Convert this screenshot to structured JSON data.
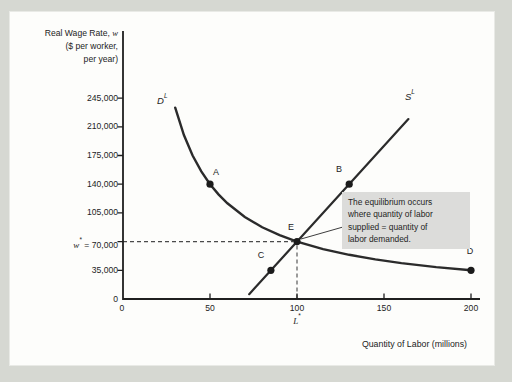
{
  "figure": {
    "colors": {
      "page_bg": "#d6d8d2",
      "panel_bg": "#fdfdfb",
      "ink": "#232323",
      "annotation_bg": "#dcdcda"
    },
    "y_axis": {
      "title_prefix": "Real Wage Rate, ",
      "title_var": "w",
      "title_line2": "($ per worker,",
      "title_line3": "per year)",
      "tick_labels": [
        "245,000",
        "210,000",
        "175,000",
        "140,000",
        "105,000"
      ],
      "equilibrium_tick": {
        "var": "w",
        "sup": "*",
        "rest": " = 70,000"
      },
      "tick_35": "35,000",
      "tick_0": "0"
    },
    "x_axis": {
      "title": "Quantity of Labor (millions)",
      "tick_labels": [
        "0",
        "50",
        "100",
        "150",
        "200"
      ],
      "equilibrium_tick": {
        "var": "L",
        "sup": "*"
      }
    },
    "curve_labels": {
      "demand_base": "D",
      "demand_sup": "L",
      "supply_base": "S",
      "supply_sup": "L"
    },
    "point_labels": {
      "A": "A",
      "B": "B",
      "C": "C",
      "D": "D",
      "E": "E"
    },
    "annotation": {
      "lines": [
        "The equilibrium occurs",
        "where quantity of labor",
        "supplied = quantity of",
        "labor demanded."
      ]
    }
  },
  "chart_data": {
    "type": "line",
    "title": "",
    "xlabel": "Quantity of Labor (millions)",
    "ylabel": "Real Wage Rate, w ($ per worker, per year)",
    "xlim": [
      0,
      205
    ],
    "ylim": [
      0,
      262500
    ],
    "x_ticks": [
      0,
      50,
      100,
      150,
      200
    ],
    "y_ticks": [
      0,
      35000,
      70000,
      105000,
      140000,
      175000,
      210000,
      245000
    ],
    "grid": false,
    "legend": "none",
    "series": [
      {
        "name": "Labor demand, D^L",
        "shape": "curve",
        "points": [
          [
            30,
            233333
          ],
          [
            35,
            200000
          ],
          [
            40,
            175000
          ],
          [
            45,
            155556
          ],
          [
            50,
            140000
          ],
          [
            55,
            127273
          ],
          [
            60,
            116667
          ],
          [
            70,
            100000
          ],
          [
            80,
            87500
          ],
          [
            90,
            77778
          ],
          [
            100,
            70000
          ],
          [
            115,
            60870
          ],
          [
            130,
            53846
          ],
          [
            145,
            48276
          ],
          [
            160,
            43750
          ],
          [
            180,
            38889
          ],
          [
            200,
            35000
          ]
        ]
      },
      {
        "name": "Labor supply, S^L",
        "shape": "line",
        "points": [
          [
            72.5,
            5833
          ],
          [
            164,
            219333
          ]
        ]
      }
    ],
    "labeled_points": [
      {
        "label": "A",
        "L": 50,
        "w": 140000,
        "curve": "demand"
      },
      {
        "label": "B",
        "L": 130,
        "w": 140000,
        "curve": "supply"
      },
      {
        "label": "C",
        "L": 85,
        "w": 35000,
        "curve": "supply"
      },
      {
        "label": "D",
        "L": 200,
        "w": 35000,
        "curve": "demand"
      },
      {
        "label": "E",
        "L": 100,
        "w": 70000,
        "curve": "equilibrium"
      }
    ],
    "equilibrium": {
      "L": 100,
      "w": 70000,
      "wage_label": "w* = 70,000",
      "labor_label": "L*"
    },
    "annotation": "The equilibrium occurs where quantity of labor supplied = quantity of labor demanded."
  }
}
